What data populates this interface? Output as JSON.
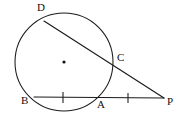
{
  "figure": {
    "width": 182,
    "height": 116,
    "background_color": "#ffffff",
    "stroke_color": "#1a1a1a"
  },
  "circle": {
    "center_x": 64,
    "center_y": 62,
    "radius": 49,
    "center_dot_radius": 1.6,
    "center_dot_color": "#111111"
  },
  "labels": {
    "d": "D",
    "c": "C",
    "b": "B",
    "a": "A",
    "p": "P"
  },
  "points": [
    {
      "name": "D",
      "x": 44,
      "y": 21,
      "label_x": 37,
      "label_y": 2,
      "on_circle": true
    },
    {
      "name": "C",
      "x": 113,
      "y": 65,
      "label_x": 117,
      "label_y": 52,
      "on_circle": true
    },
    {
      "name": "B",
      "x": 34,
      "y": 96,
      "label_x": 21,
      "label_y": 95,
      "on_circle": true
    },
    {
      "name": "A",
      "x": 99,
      "y": 97,
      "label_x": 97,
      "label_y": 99,
      "on_circle": true
    },
    {
      "name": "P",
      "x": 164,
      "y": 98,
      "label_x": 167,
      "label_y": 96,
      "on_circle": false
    }
  ],
  "segments": [
    {
      "name": "secant-DP",
      "from": "D",
      "to": "P",
      "x1": 44,
      "y1": 21,
      "x2": 164,
      "y2": 98
    },
    {
      "name": "secant-BP",
      "from": "B",
      "to": "P",
      "x1": 34,
      "y1": 97,
      "x2": 164,
      "y2": 98
    }
  ],
  "tick_marks": [
    {
      "name": "tick-BA",
      "x": 63,
      "y1": 92,
      "y2": 103
    },
    {
      "name": "tick-AP",
      "x": 128,
      "y1": 93,
      "y2": 103
    }
  ]
}
